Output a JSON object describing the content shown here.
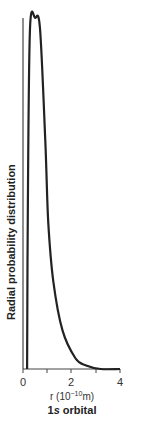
{
  "chart_data": {
    "type": "line",
    "title": "1s orbital",
    "xlabel": "r (10^-10 m)",
    "ylabel": "Radial probability distribution",
    "xlim": [
      0,
      4
    ],
    "ylim": [
      0,
      1
    ],
    "xticks": [
      0,
      1,
      2,
      3,
      4
    ],
    "xtick_labels": [
      "0",
      "2",
      "4"
    ],
    "grid": false,
    "legend": null,
    "series": [
      {
        "name": "1s radial probability",
        "x": [
          0.17,
          0.2,
          0.29,
          0.5,
          0.7,
          0.92,
          1.04,
          1.25,
          1.63,
          2.17,
          2.6,
          3.2,
          4.0
        ],
        "y": [
          0.0,
          0.48,
          0.97,
          1.0,
          0.97,
          0.65,
          0.42,
          0.25,
          0.11,
          0.03,
          0.01,
          0.0,
          0.0
        ]
      }
    ]
  },
  "labels": {
    "ylabel": "Radial probability distribution",
    "xlabel_prefix": "r (10",
    "xlabel_exp": "−10",
    "xlabel_suffix": "m)",
    "title_num": "1",
    "title_s": "s",
    "title_rest": " orbital",
    "tick_0": "0",
    "tick_2": "2",
    "tick_4": "4"
  },
  "colors": {
    "line": "#222222",
    "axis": "#444444"
  }
}
